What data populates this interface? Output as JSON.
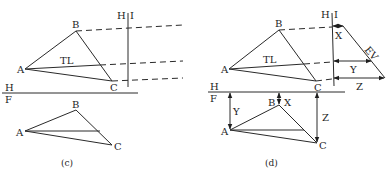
{
  "figure_c": {
    "caption": "(c)",
    "top_view": {
      "A": "A",
      "B": "B",
      "C": "C",
      "tl_label": "TL"
    },
    "fold_line_hi": {
      "left": "H",
      "right": "I"
    },
    "fold_line_hf": {
      "top": "H",
      "bottom": "F"
    },
    "front_view": {
      "A": "A",
      "B": "B",
      "C": "C"
    }
  },
  "figure_d": {
    "caption": "(d)",
    "top_view": {
      "A": "A",
      "B": "B",
      "C": "C",
      "tl_label": "TL"
    },
    "fold_line_hi": {
      "left": "H",
      "right": "I"
    },
    "fold_line_hf": {
      "top": "H",
      "bottom": "F"
    },
    "aux_view": {
      "ev_label": "EV",
      "x_label": "X",
      "y_label": "Y",
      "z_label": "Z"
    },
    "front_view": {
      "A": "A",
      "B": "B",
      "C": "C",
      "x_label": "X",
      "y_label": "Y",
      "z_label": "Z"
    }
  }
}
